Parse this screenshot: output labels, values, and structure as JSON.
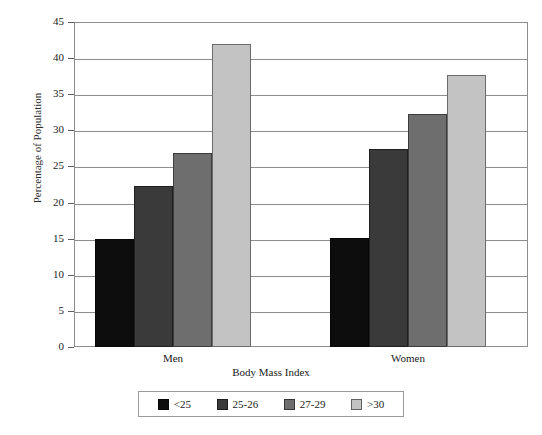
{
  "chart_data": {
    "type": "bar",
    "title": "",
    "xlabel": "Body Mass Index",
    "ylabel": "Percentage of Population",
    "categories": [
      "Men",
      "Women"
    ],
    "series": [
      {
        "name": "<25",
        "color": "#0d0d0d",
        "values": [
          14.9,
          15.1
        ]
      },
      {
        "name": "25-26",
        "color": "#3a3a3a",
        "values": [
          22.3,
          27.4
        ]
      },
      {
        "name": "27-29",
        "color": "#6e6e6e",
        "values": [
          26.8,
          32.3
        ]
      },
      {
        "name": ">30",
        "color": "#c3c3c3",
        "values": [
          42.0,
          37.7
        ]
      }
    ],
    "ylim": [
      0,
      45
    ],
    "ytick_step": 5,
    "yticks": [
      0,
      5,
      10,
      15,
      20,
      25,
      30,
      35,
      40,
      45
    ],
    "ytick_labels": [
      "0",
      "5",
      "10",
      "15",
      "20",
      "25",
      "30",
      "35",
      "40",
      "45"
    ],
    "grid": true,
    "grid_axis": "y",
    "legend_position": "bottom",
    "legend_entries": [
      "<25",
      "25-26",
      "27-29",
      ">30"
    ],
    "bar_mode": "grouped",
    "frame": true
  },
  "axis": {
    "y_title": "Percentage of Population",
    "x_title": "Body Mass Index"
  },
  "colors": {
    "frame": "#8d8d8d",
    "gridline": "#8d8d8d",
    "tick": "#5e6060",
    "text": "#1a1a1a",
    "legend_border": "#9a9a9a",
    "background": "#ffffff"
  }
}
